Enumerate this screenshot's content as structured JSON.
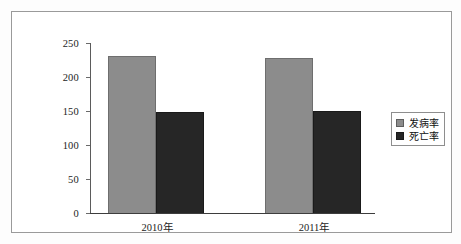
{
  "chart_data": {
    "type": "bar",
    "title": "",
    "subtitle": "",
    "xlabel": "",
    "ylabel": "",
    "categories": [
      "2010年",
      "2011年"
    ],
    "series": [
      {
        "name": "发病率",
        "values": [
          231,
          228
        ],
        "color": "#8c8c8c"
      },
      {
        "name": "死亡率",
        "values": [
          148,
          150
        ],
        "color": "#262626"
      }
    ],
    "ylim": [
      0,
      250
    ],
    "yticks": [
      0,
      50,
      100,
      150,
      200,
      250
    ],
    "ytick_labels": [
      "0",
      "50",
      "100",
      "150",
      "200",
      "250"
    ],
    "grid": false,
    "legend_position": "right"
  },
  "legend": {
    "entries": [
      {
        "label": "发病率"
      },
      {
        "label": "死亡率"
      }
    ]
  },
  "axis": {
    "ticks": [
      {
        "label": "250",
        "value": 250
      },
      {
        "label": "200",
        "value": 200
      },
      {
        "label": "150",
        "value": 150
      },
      {
        "label": "100",
        "value": 100
      },
      {
        "label": "50",
        "value": 50
      },
      {
        "label": "0",
        "value": 0
      }
    ]
  },
  "categories": [
    {
      "label": "2010年"
    },
    {
      "label": "2011年"
    }
  ]
}
